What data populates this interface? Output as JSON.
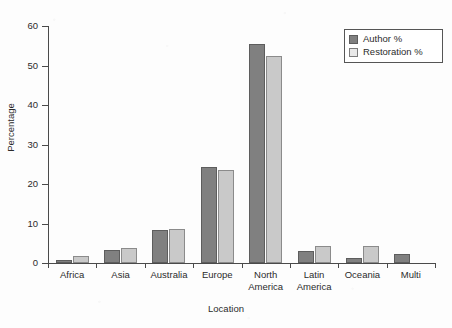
{
  "chart_data": {
    "type": "bar",
    "title": "",
    "xlabel": "Location",
    "ylabel": "Percentage",
    "ylim": [
      0,
      60
    ],
    "yticks": [
      0,
      10,
      20,
      30,
      40,
      50,
      60
    ],
    "grid": false,
    "legend_position": "top-right",
    "categories": [
      "Africa",
      "Asia",
      "Australia",
      "Europe",
      "North\nAmerica",
      "Latin\nAmerica",
      "Oceania",
      "Multi"
    ],
    "series": [
      {
        "name": "Author %",
        "color": "#808080",
        "values": [
          0.7,
          3.2,
          8.3,
          24.2,
          55.5,
          3.1,
          1.2,
          2.2
        ]
      },
      {
        "name": "Restoration %",
        "color": "#c9c9c9",
        "values": [
          1.8,
          3.8,
          8.6,
          23.5,
          52.5,
          4.3,
          4.3,
          0
        ]
      }
    ]
  },
  "legend": {
    "items": [
      {
        "label": "Author %",
        "swatch": "author-swatch-icon"
      },
      {
        "label": "Restoration %",
        "swatch": "restoration-swatch-icon"
      }
    ]
  },
  "axes": {
    "y_title": "Percentage",
    "x_title": "Location"
  }
}
